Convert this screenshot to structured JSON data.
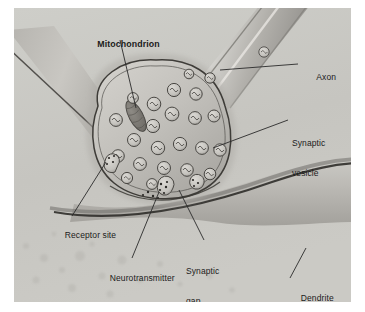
{
  "figure": {
    "style": "grayscale-airbrush-illustration",
    "background_color": "#c8c8c6",
    "frame_color": "#ffffff"
  },
  "labels": [
    {
      "id": "mitochondrion",
      "text": "Mitochondrion",
      "bold": true,
      "lines": [
        "Mitochondrion"
      ],
      "x": 68,
      "y": 21
    },
    {
      "id": "axon",
      "text": "Axon",
      "bold": false,
      "lines": [
        "Axon"
      ],
      "x": 288,
      "y": 54
    },
    {
      "id": "synaptic-vesicle",
      "text": "Synaptic vesicle",
      "bold": false,
      "lines": [
        "Synaptic",
        "vesicle"
      ],
      "x": 278,
      "y": 110
    },
    {
      "id": "receptor-site",
      "text": "Receptor site",
      "bold": false,
      "lines": [
        "Receptor site"
      ],
      "x": 36,
      "y": 212
    },
    {
      "id": "neurotransmitter",
      "text": "Neurotransmitter",
      "bold": false,
      "lines": [
        "Neurotransmitter"
      ],
      "x": 81,
      "y": 255
    },
    {
      "id": "synaptic-gap",
      "text": "Synaptic gap",
      "bold": false,
      "lines": [
        "Synaptic",
        "gap"
      ],
      "x": 172,
      "y": 238
    },
    {
      "id": "dendrite",
      "text": "Dendrite",
      "bold": false,
      "lines": [
        "Dendrite"
      ],
      "x": 272,
      "y": 275
    }
  ],
  "structures": {
    "axon": {
      "name": "Axon",
      "description": "tubular fiber entering from upper right"
    },
    "terminal_bouton": {
      "name": "Axon terminal",
      "description": "bulb-shaped presynaptic terminal"
    },
    "mitochondrion": {
      "name": "Mitochondrion",
      "description": "elongated dark organelle inside terminal"
    },
    "synaptic_vesicles": {
      "name": "Synaptic vesicles",
      "count": 26,
      "description": "round sacs with internal squiggle texture"
    },
    "neurotransmitter": {
      "name": "Neurotransmitter",
      "description": "small dark dots released into the gap"
    },
    "synaptic_gap": {
      "name": "Synaptic gap",
      "description": "narrow cleft between terminal and dendrite"
    },
    "receptor_site": {
      "name": "Receptor site",
      "description": "dark band on postsynaptic membrane"
    },
    "dendrite": {
      "name": "Dendrite",
      "description": "broad postsynaptic band crossing lower half"
    }
  },
  "colors": {
    "background": "#c8c8c6",
    "membrane_dark": "#4a4a48",
    "cytoplasm": "#b9b7b2",
    "terminal_fill": "#c4c2bd",
    "vesicle_fill": "#cfcdc8",
    "label_text": "#1b1b1b",
    "leader_line": "#2a2a2a"
  }
}
